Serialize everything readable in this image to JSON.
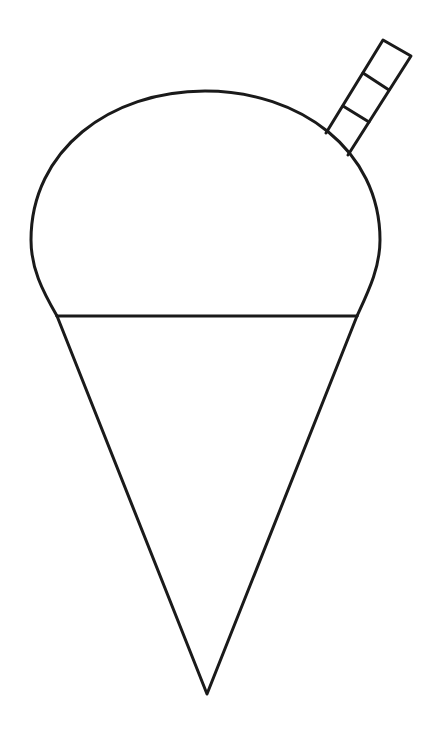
{
  "image": {
    "subject": "snow cone with straw line drawing",
    "background": "#ffffff",
    "stroke_color": "#1a1a1a",
    "stroke_width": 3
  },
  "parts": {
    "ice_dome": "shaved-ice-dome",
    "rim_line": "cone-rim",
    "cone": "paper-cone",
    "straw": "straw"
  }
}
